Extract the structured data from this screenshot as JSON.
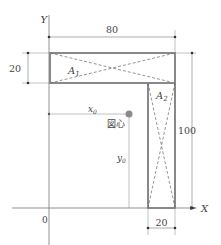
{
  "diagram": {
    "axes": {
      "x_label": "X",
      "y_label": "Y",
      "origin_label": "0"
    },
    "dimensions": {
      "top_width": "80",
      "left_height": "20",
      "right_height": "100",
      "bottom_width": "20"
    },
    "areas": {
      "a1": "A",
      "a1_sub": "1",
      "a2": "A",
      "a2_sub": "2"
    },
    "centroid": {
      "label": "図心",
      "x0": "x",
      "x0_sub": "0",
      "y0": "y",
      "y0_sub": "0"
    },
    "colors": {
      "shape_stroke": "#888888",
      "centroid_dot": "#8a8a8a",
      "line": "#555555"
    }
  }
}
